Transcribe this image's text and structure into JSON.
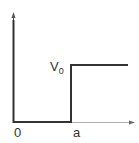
{
  "diagram": {
    "type": "potential-step",
    "labels": {
      "potential": "V",
      "potential_subscript": "0",
      "origin": "0",
      "step_position": "a"
    },
    "colors": {
      "line": "#333333",
      "axis": "#888888",
      "background": "#ffffff"
    }
  }
}
